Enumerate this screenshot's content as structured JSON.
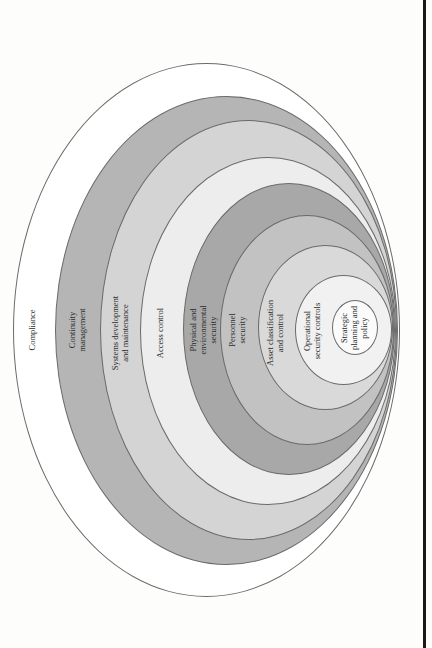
{
  "figure": {
    "type": "nested-ellipse-diagram",
    "orientation": "rotated-90-ccw",
    "layers": [
      {
        "id": "compliance",
        "label": "Compliance",
        "fill": "#ffffff",
        "left": 13,
        "top": 63,
        "right": 400,
        "bottom": 597,
        "label_x": 32,
        "label_y": 330
      },
      {
        "id": "continuity",
        "label": "Continuity\nmanagement",
        "fill": "#b5b5b5",
        "left": 55,
        "top": 96,
        "right": 398,
        "bottom": 565,
        "label_x": 77,
        "label_y": 330
      },
      {
        "id": "systems-dev",
        "label": "Systems development\nand maintenance",
        "fill": "#d4d4d4",
        "left": 100,
        "top": 120,
        "right": 397,
        "bottom": 540,
        "label_x": 120,
        "label_y": 333
      },
      {
        "id": "access-control",
        "label": "Access control",
        "fill": "#ededed",
        "left": 140,
        "top": 157,
        "right": 396,
        "bottom": 505,
        "label_x": 160,
        "label_y": 333
      },
      {
        "id": "physical",
        "label": "Physical and\nenvironmental\nsecurity",
        "fill": "#a8a8a8",
        "left": 183,
        "top": 183,
        "right": 395,
        "bottom": 475,
        "label_x": 203,
        "label_y": 330
      },
      {
        "id": "personnel",
        "label": "Personnel\nsecurity",
        "fill": "#c2c2c2",
        "left": 220,
        "top": 215,
        "right": 394,
        "bottom": 445,
        "label_x": 237,
        "label_y": 330
      },
      {
        "id": "asset",
        "label": "Asset classification\nand control",
        "fill": "#d9d9d9",
        "left": 258,
        "top": 245,
        "right": 393,
        "bottom": 410,
        "label_x": 275,
        "label_y": 333
      },
      {
        "id": "operational",
        "label": "Operational\nsecurity controls",
        "fill": "#f1f1f1",
        "left": 295,
        "top": 275,
        "right": 392,
        "bottom": 385,
        "label_x": 312,
        "label_y": 331
      },
      {
        "id": "strategic",
        "label": "Strategic\nplanning and\npolicy",
        "fill": "#fbfbfb",
        "left": 332,
        "top": 300,
        "right": 378,
        "bottom": 355,
        "label_x": 354,
        "label_y": 328
      }
    ]
  },
  "colors": {
    "outline": "#6a6a6a",
    "text": "#2a2a2a",
    "page_edge": "#1a1a1a",
    "background": "#fdfdfc"
  }
}
